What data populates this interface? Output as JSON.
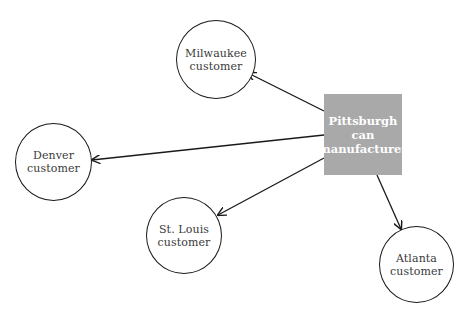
{
  "diagram": {
    "type": "hub-and-spoke distribution",
    "hub": {
      "id": "pittsburgh",
      "lines": [
        "Pittsburgh",
        "can",
        "manufacturer"
      ],
      "shape": "rectangle",
      "fill": "#a9a9a9",
      "text_color": "#ffffff"
    },
    "nodes": [
      {
        "id": "milwaukee",
        "lines": [
          "Milwaukee",
          "customer"
        ],
        "shape": "circle"
      },
      {
        "id": "denver",
        "lines": [
          "Denver",
          "customer"
        ],
        "shape": "circle"
      },
      {
        "id": "stlouis",
        "lines": [
          "St. Louis",
          "customer"
        ],
        "shape": "circle"
      },
      {
        "id": "atlanta",
        "lines": [
          "Atlanta",
          "customer"
        ],
        "shape": "circle"
      }
    ],
    "edges": [
      {
        "from": "pittsburgh",
        "to": "milwaukee",
        "directed": true
      },
      {
        "from": "pittsburgh",
        "to": "denver",
        "directed": true
      },
      {
        "from": "pittsburgh",
        "to": "stlouis",
        "directed": true
      },
      {
        "from": "pittsburgh",
        "to": "atlanta",
        "directed": true
      }
    ],
    "colors": {
      "stroke": "#1a1a1a",
      "hub_fill": "#a9a9a9",
      "background": "#ffffff"
    }
  }
}
